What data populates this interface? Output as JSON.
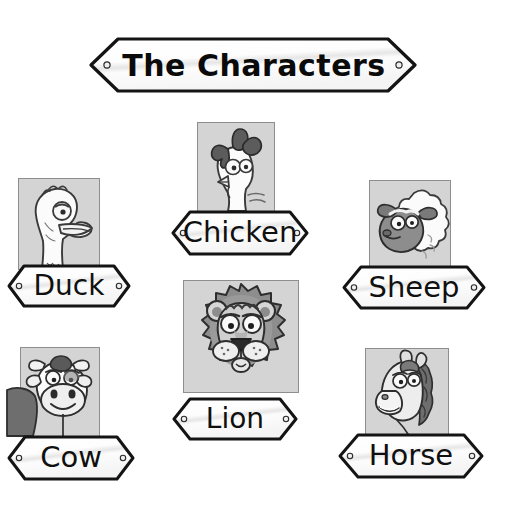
{
  "page": {
    "title": "The Characters",
    "background_color": "#ffffff",
    "width": 507,
    "height": 520
  },
  "title_sign": {
    "label": "The Characters",
    "shape": "double-arrow-banner",
    "rivets": 2,
    "plate_color": "#fdfdfd",
    "outline_color": "#141414",
    "text_color": "#0a0a0a"
  },
  "style": {
    "frame_fill": "#d4d4d4",
    "frame_border": "#8e8e8e",
    "sign_fill": "#fcfcfc",
    "sign_outline": "#141414",
    "rivet_fill": "#efefef",
    "rivet_outline": "#2a2a2a",
    "ink": "#2b2b2b",
    "mid_grey": "#8d8d8d",
    "dark_grey": "#5a5a5a",
    "light_grey": "#e8e8e8",
    "white": "#fbfbfb"
  },
  "characters": [
    {
      "id": "duck",
      "label": "Duck",
      "icon": "duck-portrait-icon",
      "frame": {
        "x": 18,
        "y": 178,
        "w": 82,
        "h": 92
      },
      "sign": {
        "x": 6,
        "y": 263,
        "w": 126,
        "h": 46
      },
      "font_size": 28
    },
    {
      "id": "chicken",
      "label": "Chicken",
      "icon": "chicken-portrait-icon",
      "frame": {
        "x": 197,
        "y": 122,
        "w": 78,
        "h": 90
      },
      "sign": {
        "x": 170,
        "y": 209,
        "w": 140,
        "h": 48
      },
      "font_size": 29
    },
    {
      "id": "sheep",
      "label": "Sheep",
      "icon": "sheep-portrait-icon",
      "frame": {
        "x": 369,
        "y": 180,
        "w": 82,
        "h": 90
      },
      "sign": {
        "x": 341,
        "y": 264,
        "w": 146,
        "h": 47
      },
      "font_size": 29
    },
    {
      "id": "lion",
      "label": "Lion",
      "icon": "lion-portrait-icon",
      "frame": {
        "x": 183,
        "y": 280,
        "w": 116,
        "h": 113
      },
      "sign": {
        "x": 171,
        "y": 396,
        "w": 128,
        "h": 46
      },
      "font_size": 28
    },
    {
      "id": "cow",
      "label": "Cow",
      "icon": "cow-portrait-icon",
      "frame": {
        "x": 20,
        "y": 347,
        "w": 80,
        "h": 90
      },
      "sign": {
        "x": 6,
        "y": 434,
        "w": 130,
        "h": 48
      },
      "font_size": 29
    },
    {
      "id": "horse",
      "label": "Horse",
      "icon": "horse-portrait-icon",
      "frame": {
        "x": 365,
        "y": 348,
        "w": 84,
        "h": 90
      },
      "sign": {
        "x": 337,
        "y": 432,
        "w": 148,
        "h": 48
      },
      "font_size": 29
    }
  ]
}
